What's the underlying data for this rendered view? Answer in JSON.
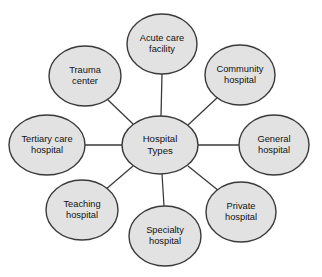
{
  "diagram": {
    "type": "radial-hub-and-spoke",
    "canvas": {
      "width": 322,
      "height": 277
    },
    "colors": {
      "background": "#ffffff",
      "node_fill": "#e2e2e2",
      "node_stroke": "#3a3a3a",
      "connector": "#3a3a3a",
      "label_text": "#121212"
    },
    "center": {
      "id": "hospital-types",
      "label_line1": "Hospital",
      "label_line2": "Types",
      "cx": 160,
      "cy": 145,
      "rx": 38,
      "ry": 29
    },
    "nodes": [
      {
        "id": "acute-care-facility",
        "label_line1": "Acute care",
        "label_line2": "facility",
        "position": "top",
        "cx": 162,
        "cy": 44,
        "rx": 35,
        "ry": 30
      },
      {
        "id": "community-hospital",
        "label_line1": "Community",
        "label_line2": "hospital",
        "position": "upper-right",
        "cx": 240,
        "cy": 75,
        "rx": 35,
        "ry": 30
      },
      {
        "id": "general-hospital",
        "label_line1": "General",
        "label_line2": "hospital",
        "position": "right",
        "cx": 274,
        "cy": 145,
        "rx": 35,
        "ry": 30
      },
      {
        "id": "private-hospital",
        "label_line1": "Private",
        "label_line2": "hospital",
        "position": "lower-right",
        "cx": 241,
        "cy": 212,
        "rx": 35,
        "ry": 30
      },
      {
        "id": "specialty-hospital",
        "label_line1": "Specialty",
        "label_line2": "hospital",
        "position": "bottom",
        "cx": 165,
        "cy": 236,
        "rx": 36,
        "ry": 30
      },
      {
        "id": "teaching-hospital",
        "label_line1": "Teaching",
        "label_line2": "hospital",
        "position": "lower-left",
        "cx": 82,
        "cy": 210,
        "rx": 36,
        "ry": 30
      },
      {
        "id": "tertiary-care-hospital",
        "label_line1": "Tertiary care",
        "label_line2": "hospital",
        "position": "left",
        "cx": 47,
        "cy": 145,
        "rx": 38,
        "ry": 30
      },
      {
        "id": "trauma-center",
        "label_line1": "Trauma",
        "label_line2": "center",
        "position": "upper-left",
        "cx": 85,
        "cy": 76,
        "rx": 36,
        "ry": 30
      }
    ],
    "connectors": [
      {
        "id": "center-to-acute-care-facility",
        "x1": 161,
        "y1": 116,
        "x2": 162,
        "y2": 74
      },
      {
        "id": "center-to-community-hospital",
        "x1": 188,
        "y1": 125,
        "x2": 218,
        "y2": 97
      },
      {
        "id": "center-to-general-hospital",
        "x1": 198,
        "y1": 145,
        "x2": 239,
        "y2": 145
      },
      {
        "id": "center-to-private-hospital",
        "x1": 188,
        "y1": 166,
        "x2": 219,
        "y2": 191
      },
      {
        "id": "center-to-specialty-hospital",
        "x1": 162,
        "y1": 174,
        "x2": 164,
        "y2": 206
      },
      {
        "id": "center-to-teaching-hospital",
        "x1": 133,
        "y1": 166,
        "x2": 105,
        "y2": 190
      },
      {
        "id": "center-to-tertiary-care-hospital",
        "x1": 122,
        "y1": 145,
        "x2": 85,
        "y2": 145
      },
      {
        "id": "center-to-trauma-center",
        "x1": 133,
        "y1": 124,
        "x2": 107,
        "y2": 99
      }
    ]
  }
}
